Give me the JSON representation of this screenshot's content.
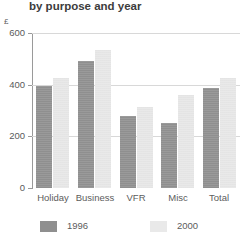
{
  "chart_data": {
    "type": "bar",
    "title": "by purpose and year",
    "xlabel": "",
    "ylabel": "£",
    "ylim": [
      0,
      600
    ],
    "yticks": [
      0,
      200,
      400,
      600
    ],
    "ytick_labels": [
      "0",
      "200",
      "400",
      "600"
    ],
    "grid": true,
    "legend_position": "bottom",
    "categories": [
      "Holiday",
      "Business",
      "VFR",
      "Misc",
      "Total"
    ],
    "series": [
      {
        "name": "1996",
        "color": "#8f8f8f",
        "values": [
          395,
          490,
          280,
          250,
          388
        ]
      },
      {
        "name": "2000",
        "color": "#e9e9e9",
        "values": [
          425,
          535,
          315,
          360,
          425
        ]
      }
    ]
  },
  "colors": {
    "series_1996": "#8f8f8f",
    "series_2000": "#e9e9e9",
    "axis": "#9a9a9a",
    "gridline": "#d8d8d8",
    "text": "#5c5c5c",
    "background": "#ffffff"
  }
}
